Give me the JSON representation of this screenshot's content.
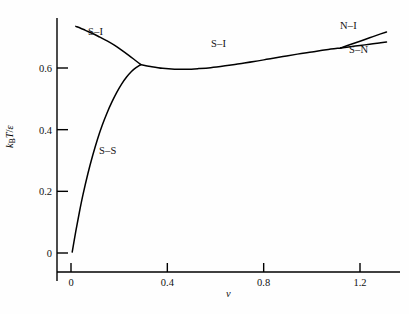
{
  "figure": {
    "type": "phase-diagram",
    "background": "#fefefe",
    "line_color": "#000000"
  },
  "axes": {
    "x": {
      "label": "ν",
      "ticks": [
        0,
        0.4,
        0.8,
        1.2
      ],
      "tick_labels": [
        "0",
        "0.4",
        "0.8",
        "1.2"
      ],
      "range": [
        -0.06,
        1.33
      ],
      "px": {
        "x0": 71,
        "x1": 360,
        "v0": 0,
        "v1": 1.2,
        "axis_y": 272,
        "start": 57,
        "end": 400
      }
    },
    "y": {
      "label_parts": {
        "k": "k",
        "sub": "B",
        "T": "T",
        "slash": "/",
        "eps": "ε"
      },
      "label": "k_B T/ε",
      "ticks": [
        0,
        0.2,
        0.4,
        0.6
      ],
      "tick_labels": [
        "0",
        "0.2",
        "0.4",
        "0.6"
      ],
      "range": [
        -0.06,
        0.75
      ],
      "px": {
        "y0": 253,
        "y1": 68,
        "v0": 0,
        "v1": 0.6,
        "axis_x": 57,
        "top": 18,
        "bottom": 281
      }
    }
  },
  "curve_labels": [
    {
      "name": "s-i-upper",
      "text": "S–I",
      "x": 88,
      "y": 26
    },
    {
      "name": "s-i-middle",
      "text": "S–I",
      "x": 211,
      "y": 38
    },
    {
      "name": "s-s",
      "text": "S–S",
      "x": 99,
      "y": 145
    },
    {
      "name": "n-i",
      "text": "N–I",
      "x": 340,
      "y": 20
    },
    {
      "name": "s-n",
      "text": "S–N",
      "x": 349,
      "y": 44
    }
  ],
  "chart_data": {
    "type": "line",
    "title": "",
    "xlabel": "ν",
    "ylabel": "k_B T/ε",
    "xlim": [
      -0.06,
      1.33
    ],
    "ylim": [
      -0.06,
      0.75
    ],
    "xticks": [
      0,
      0.4,
      0.8,
      1.2
    ],
    "yticks": [
      0,
      0.2,
      0.4,
      0.6
    ],
    "grid": false,
    "legend": "inline-annotations",
    "annotations": [
      "S–I",
      "S–I",
      "S–S",
      "N–I",
      "S–N"
    ],
    "triple_point": {
      "nu": 0.29,
      "T": 0.61
    },
    "branch_point": {
      "nu": 1.12,
      "T": 0.665
    },
    "series": [
      {
        "name": "S–I (upper branch)",
        "points": [
          [
            0.02,
            0.735
          ],
          [
            0.04,
            0.729
          ],
          [
            0.06,
            0.722
          ],
          [
            0.09,
            0.712
          ],
          [
            0.12,
            0.7
          ],
          [
            0.15,
            0.688
          ],
          [
            0.18,
            0.674
          ],
          [
            0.21,
            0.658
          ],
          [
            0.24,
            0.641
          ],
          [
            0.265,
            0.626
          ],
          [
            0.28,
            0.617
          ],
          [
            0.29,
            0.611
          ]
        ]
      },
      {
        "name": "S–S",
        "points": [
          [
            0.005,
            0.003
          ],
          [
            0.02,
            0.071
          ],
          [
            0.035,
            0.133
          ],
          [
            0.05,
            0.19
          ],
          [
            0.07,
            0.257
          ],
          [
            0.09,
            0.316
          ],
          [
            0.11,
            0.369
          ],
          [
            0.13,
            0.415
          ],
          [
            0.15,
            0.455
          ],
          [
            0.17,
            0.49
          ],
          [
            0.19,
            0.521
          ],
          [
            0.21,
            0.548
          ],
          [
            0.23,
            0.57
          ],
          [
            0.25,
            0.588
          ],
          [
            0.27,
            0.601
          ],
          [
            0.29,
            0.611
          ]
        ]
      },
      {
        "name": "S–I (middle branch)",
        "points": [
          [
            0.29,
            0.611
          ],
          [
            0.33,
            0.605
          ],
          [
            0.38,
            0.599
          ],
          [
            0.43,
            0.596
          ],
          [
            0.48,
            0.596
          ],
          [
            0.53,
            0.598
          ],
          [
            0.58,
            0.601
          ],
          [
            0.64,
            0.607
          ],
          [
            0.7,
            0.614
          ],
          [
            0.76,
            0.621
          ],
          [
            0.82,
            0.629
          ],
          [
            0.88,
            0.637
          ],
          [
            0.94,
            0.645
          ],
          [
            1.0,
            0.652
          ],
          [
            1.06,
            0.659
          ],
          [
            1.12,
            0.665
          ]
        ]
      },
      {
        "name": "N–I",
        "points": [
          [
            1.12,
            0.665
          ],
          [
            1.16,
            0.676
          ],
          [
            1.2,
            0.687
          ],
          [
            1.24,
            0.698
          ],
          [
            1.28,
            0.709
          ],
          [
            1.31,
            0.717
          ]
        ]
      },
      {
        "name": "S–N",
        "points": [
          [
            1.12,
            0.665
          ],
          [
            1.16,
            0.669
          ],
          [
            1.2,
            0.673
          ],
          [
            1.24,
            0.677
          ],
          [
            1.28,
            0.681
          ],
          [
            1.31,
            0.684
          ]
        ]
      }
    ]
  }
}
